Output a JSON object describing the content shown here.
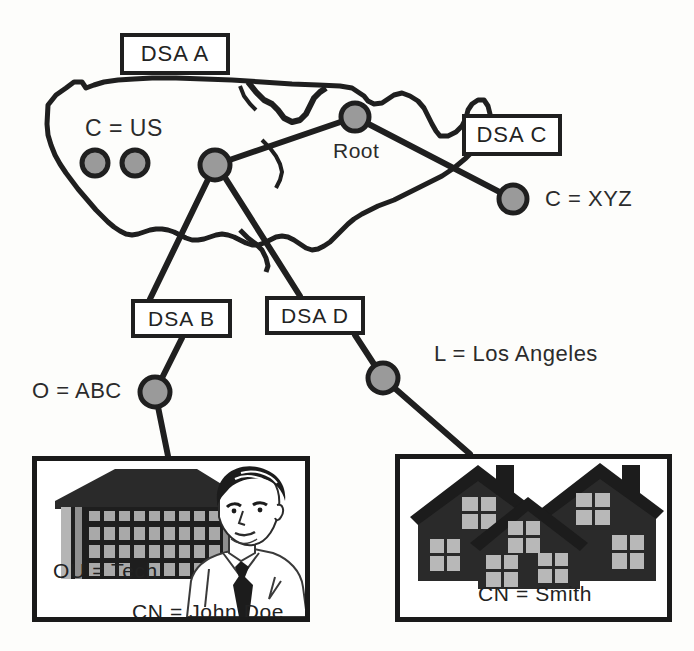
{
  "diagram": {
    "title_implied": "X.500 DSA / DIT distribution diagram",
    "background_color": "#fdfdfb",
    "line_color": "#1f1f1f",
    "node_fill": "#9a9a9a",
    "node_stroke": "#1f1f1f"
  },
  "boxes": [
    {
      "id": "dsa_a",
      "label": "DSA  A",
      "x": 120,
      "y": 33,
      "w": 110,
      "h": 42
    },
    {
      "id": "dsa_c",
      "label": "DSA  C",
      "x": 462,
      "y": 114,
      "w": 100,
      "h": 42
    },
    {
      "id": "dsa_b",
      "label": "DSA  B",
      "x": 131,
      "y": 299,
      "w": 101,
      "h": 39
    },
    {
      "id": "dsa_d",
      "label": "DSA  D",
      "x": 265,
      "y": 296,
      "w": 100,
      "h": 39
    }
  ],
  "nodes": [
    {
      "id": "us_west",
      "label": "",
      "cx": 95,
      "cy": 163,
      "r": 13
    },
    {
      "id": "us_mid",
      "label": "",
      "cx": 135,
      "cy": 163,
      "r": 13
    },
    {
      "id": "us_east",
      "label": "",
      "cx": 215,
      "cy": 165,
      "r": 15
    },
    {
      "id": "root",
      "label": "Root",
      "cx": 355,
      "cy": 117,
      "r": 14
    },
    {
      "id": "xyz",
      "label": "C = XYZ",
      "cx": 513,
      "cy": 199,
      "r": 14
    },
    {
      "id": "abc",
      "label": "O = ABC",
      "cx": 155,
      "cy": 392,
      "r": 15
    },
    {
      "id": "la",
      "label": "L = Los Angeles",
      "cx": 383,
      "cy": 378,
      "r": 15
    }
  ],
  "labels": {
    "country_us": "C = US",
    "root": "Root",
    "country_xyz": "C = XYZ",
    "org_abc": "O = ABC",
    "locality_la": "L = Los Angeles",
    "org_unit_tech": "OU = Tech",
    "common_name_john": "CN = John Doe",
    "common_name_smith": "CN = Smith"
  },
  "picture_boxes": [
    {
      "id": "tech_box",
      "x": 32,
      "y": 456,
      "w": 278,
      "h": 166,
      "image": "office-building-and-man-illustration",
      "labels": [
        "OU = Tech",
        "CN = John Doe"
      ]
    },
    {
      "id": "smith_box",
      "x": 395,
      "y": 454,
      "w": 277,
      "h": 168,
      "image": "suburban-houses-illustration",
      "labels": [
        "CN = Smith"
      ]
    }
  ],
  "edges": [
    {
      "from": "us_east",
      "to": "root"
    },
    {
      "from": "root",
      "to": "xyz"
    },
    {
      "from": "us_east",
      "to": "dsa_b"
    },
    {
      "from": "us_east",
      "to": "dsa_d"
    },
    {
      "from": "dsa_b",
      "to": "abc"
    },
    {
      "from": "abc",
      "to": "tech_box"
    },
    {
      "from": "dsa_d",
      "to": "la"
    },
    {
      "from": "la",
      "to": "smith_box"
    }
  ],
  "map": {
    "name": "united-states-outline",
    "stroke": "#1f1f1f"
  }
}
